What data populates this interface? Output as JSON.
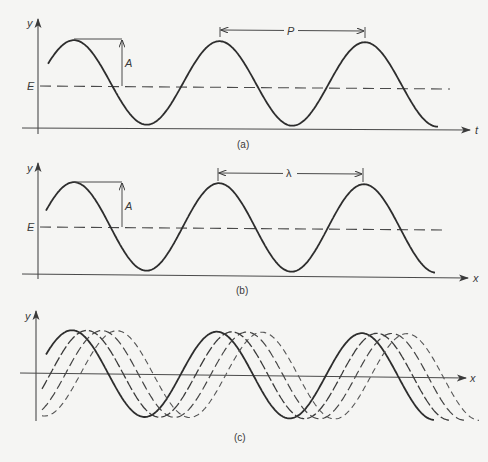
{
  "panels": [
    {
      "id": "a",
      "caption": "(a)",
      "y_axis_label": "y",
      "horizontal_axis_label": "t",
      "equilibrium_label": "E",
      "amplitude_label": "A",
      "period_label": "P",
      "description": "Displacement vs time with amplitude A about equilibrium E and period P"
    },
    {
      "id": "b",
      "caption": "(b)",
      "y_axis_label": "y",
      "horizontal_axis_label": "x",
      "equilibrium_label": "E",
      "amplitude_label": "A",
      "wavelength_label": "λ",
      "description": "Displacement vs position with amplitude A about equilibrium E and wavelength λ"
    },
    {
      "id": "c",
      "caption": "(c)",
      "y_axis_label": "y",
      "horizontal_axis_label": "x",
      "description": "Four successive snapshots of a travelling wave shifted along x (one solid, three dashed)",
      "snapshots": [
        {
          "style": "solid"
        },
        {
          "style": "long-dash"
        },
        {
          "style": "medium-dash"
        },
        {
          "style": "short-dash"
        }
      ]
    }
  ],
  "colors": {
    "background": "#f5f5f3",
    "ink": "#2d2d2d"
  }
}
